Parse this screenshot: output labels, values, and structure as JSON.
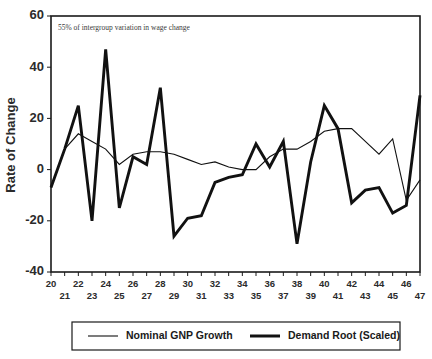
{
  "chart_data": {
    "type": "line",
    "title": "",
    "xlabel": "",
    "ylabel": "Rate of Change",
    "xlim": [
      20,
      47
    ],
    "ylim": [
      -40,
      60
    ],
    "yticks": [
      -40,
      -20,
      0,
      20,
      40,
      60
    ],
    "grid": false,
    "legend_position": "bottom",
    "annotation": "55% of intergroup variation in wage change",
    "x": [
      20,
      21,
      22,
      23,
      24,
      25,
      26,
      27,
      28,
      29,
      30,
      31,
      32,
      33,
      34,
      35,
      36,
      37,
      38,
      39,
      40,
      41,
      42,
      43,
      44,
      45,
      46,
      47
    ],
    "xtick_labels_top": [
      20,
      22,
      24,
      26,
      28,
      30,
      32,
      34,
      36,
      38,
      40,
      42,
      44,
      46
    ],
    "xtick_labels_bottom": [
      21,
      23,
      25,
      27,
      29,
      31,
      33,
      35,
      37,
      39,
      41,
      43,
      45,
      47
    ],
    "series": [
      {
        "name": "Nominal GNP Growth",
        "style": "thin",
        "values": [
          -7,
          8,
          14,
          11,
          8,
          2,
          6,
          7,
          7,
          6,
          4,
          2,
          3,
          1,
          0,
          0,
          5,
          8,
          8,
          11,
          15,
          16,
          16,
          11,
          6,
          12,
          -12,
          -4
        ]
      },
      {
        "name": "Demand  Root (Scaled)",
        "style": "thick",
        "values": [
          -7,
          8,
          25,
          -20,
          47,
          -15,
          5,
          2,
          32,
          -26,
          -19,
          -18,
          -5,
          -3,
          -2,
          10,
          1,
          11,
          -29,
          3,
          25,
          16,
          -13,
          -8,
          -7,
          -17,
          -14,
          29
        ]
      }
    ]
  },
  "legend": {
    "items": [
      {
        "label": "Nominal GNP Growth",
        "style": "thin"
      },
      {
        "label": "Demand  Root (Scaled)",
        "style": "thick"
      }
    ]
  }
}
